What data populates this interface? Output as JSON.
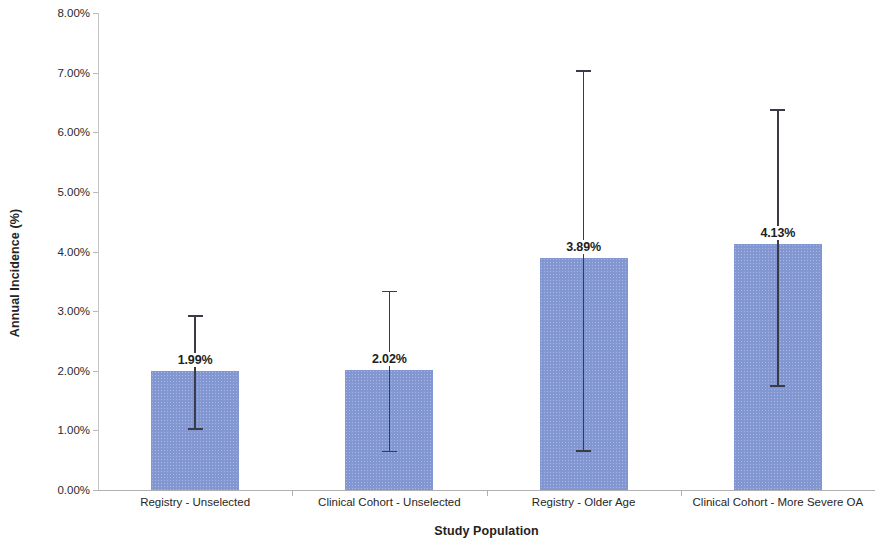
{
  "chart_data": {
    "type": "bar",
    "title": "",
    "xlabel": "Study Population",
    "ylabel": "Annual Incidence (%)",
    "categories": [
      "Registry - Unselected",
      "Clinical Cohort - Unselected",
      "Registry - Older Age",
      "Clinical Cohort - More Severe OA"
    ],
    "values": [
      1.99,
      2.02,
      3.89,
      4.13
    ],
    "data_labels": [
      "1.99%",
      "2.02%",
      "3.89%",
      "4.13%"
    ],
    "error_bars": {
      "upper": [
        2.93,
        3.34,
        7.04,
        6.39
      ],
      "lower": [
        1.04,
        0.66,
        0.67,
        1.76
      ]
    },
    "ylim": [
      0,
      8
    ],
    "ytick_values": [
      0,
      1,
      2,
      3,
      4,
      5,
      6,
      7,
      8
    ],
    "ytick_labels": [
      "0.00%",
      "1.00%",
      "2.00%",
      "3.00%",
      "4.00%",
      "5.00%",
      "6.00%",
      "7.00%",
      "8.00%"
    ],
    "grid": false,
    "legend": null,
    "bar_color": "#8296d2",
    "error_bar_color": "#3b3b48",
    "axis_color": "#b0b0b0",
    "text_color": "#232323"
  }
}
